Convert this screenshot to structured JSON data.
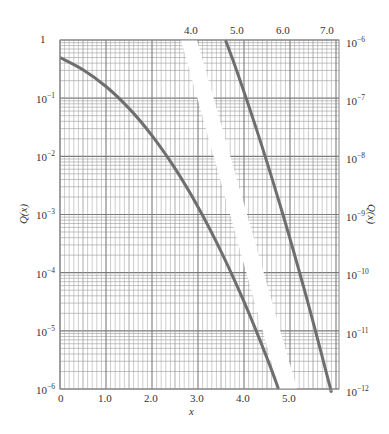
{
  "chart_data": {
    "type": "line",
    "title": "",
    "xlabel": "x",
    "ylabel_left": "Q(x)",
    "ylabel_right": "Q(x)",
    "y_scale": "log",
    "grid": true,
    "legend": null,
    "bottom_x_ticks": [
      "0",
      "1.0",
      "2.0",
      "3.0",
      "4.0",
      "5.0"
    ],
    "top_x_ticks": [
      "4.0",
      "5.0",
      "6.0",
      "7.0"
    ],
    "left_y_ticks": [
      "1",
      "10^-1",
      "10^-2",
      "10^-3",
      "10^-4",
      "10^-5",
      "10^-6"
    ],
    "right_y_ticks": [
      "10^-6",
      "10^-7",
      "10^-8",
      "10^-9",
      "10^-10",
      "10^-11",
      "10^-12"
    ],
    "left_ylim": [
      1e-06,
      1
    ],
    "right_ylim": [
      1e-12,
      1e-06
    ],
    "series": [
      {
        "name": "Q(x) (bottom/left axes)",
        "x": [
          0,
          0.5,
          1.0,
          1.5,
          2.0,
          2.5,
          3.0,
          3.5,
          4.0,
          4.5,
          4.75
        ],
        "y": [
          0.5,
          0.3085,
          0.1587,
          0.0668,
          0.02275,
          0.00621,
          0.00135,
          0.000233,
          3.17e-05,
          3.4e-06,
          1e-06
        ]
      },
      {
        "name": "Q(x) (top/right axes)",
        "x": [
          4.75,
          5.0,
          5.5,
          6.0,
          6.5,
          7.0,
          7.03
        ],
        "y": [
          1e-06,
          2.87e-07,
          1.9e-08,
          9.87e-10,
          4.02e-11,
          1.28e-12,
          1e-12
        ]
      }
    ]
  },
  "labels": {
    "left_y": [
      "1",
      "10",
      "10",
      "10",
      "10",
      "10",
      "10"
    ],
    "left_y_exp": [
      "",
      "−1",
      "−2",
      "−3",
      "−4",
      "−5",
      "−6"
    ],
    "right_y_exp": [
      "−6",
      "−7",
      "−8",
      "−9",
      "−10",
      "−11",
      "−12"
    ],
    "right_y_base": "10",
    "bottom_x": [
      "0",
      "1.0",
      "2.0",
      "3.0",
      "4.0",
      "5.0"
    ],
    "top_x": [
      "4.0",
      "5.0",
      "6.0",
      "7.0"
    ],
    "xlabel": "x",
    "ylabel": "Q(x)"
  },
  "colors": {
    "grid": "#9a9a9a",
    "grid_major": "#7a7a7a",
    "curve": "#6e6e6e",
    "text": "#333333",
    "background": "#ffffff"
  }
}
